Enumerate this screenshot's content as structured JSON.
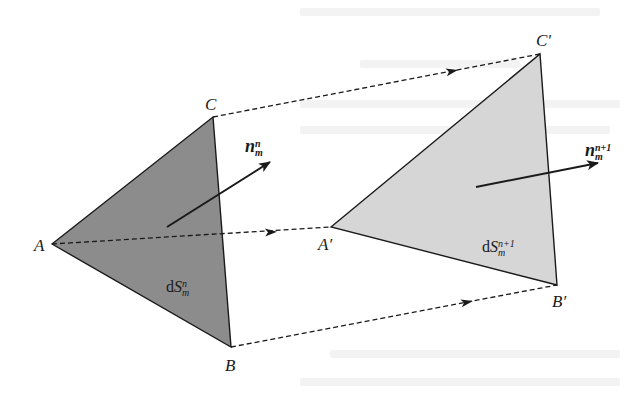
{
  "diagram": {
    "title": "",
    "vertices": {
      "A": {
        "label": "A",
        "x": 52,
        "y": 244
      },
      "B": {
        "label": "B",
        "x": 231,
        "y": 347
      },
      "C": {
        "label": "C",
        "x": 213,
        "y": 117
      },
      "A_prime": {
        "label": "A′",
        "x": 331,
        "y": 227
      },
      "B_prime": {
        "label": "B′",
        "x": 557,
        "y": 285
      },
      "C_prime": {
        "label": "C′",
        "x": 540,
        "y": 54
      }
    },
    "triangles": [
      {
        "name": "surface-element-n",
        "vertices": [
          "A",
          "B",
          "C"
        ],
        "fill": "#8c8c8c"
      },
      {
        "name": "surface-element-n-plus-1",
        "vertices": [
          "A_prime",
          "B_prime",
          "C_prime"
        ],
        "fill": "#d6d6d6"
      }
    ],
    "area_labels": {
      "dS_n": {
        "prefix": "d",
        "symbol": "S",
        "sup": "n",
        "sub": "m"
      },
      "dS_n1": {
        "prefix": "d",
        "symbol": "S",
        "sup": "n+1",
        "sub": "m"
      }
    },
    "normal_vectors": {
      "n_n": {
        "symbol": "n",
        "sup": "n",
        "sub": "m",
        "from": [
          167,
          227
        ],
        "to": [
          270,
          162
        ]
      },
      "n_n1": {
        "symbol": "n",
        "sup": "n+1",
        "sub": "m",
        "from": [
          476,
          187
        ],
        "to": [
          598,
          163
        ]
      }
    },
    "displacement_arrows": [
      {
        "from": "A",
        "to": "A_prime",
        "style": "dashed",
        "arrow_at": [
          272,
          232
        ]
      },
      {
        "from": "B",
        "to": "B_prime",
        "style": "dashed",
        "arrow_at": [
          468,
          302
        ]
      },
      {
        "from": "C",
        "to": "C_prime",
        "style": "dashed",
        "arrow_at": [
          453,
          71
        ]
      }
    ],
    "colors": {
      "stroke": "#1a1a1a",
      "dark_fill": "#8c8c8c",
      "light_fill": "#d6d6d6",
      "background": "#ffffff"
    }
  }
}
